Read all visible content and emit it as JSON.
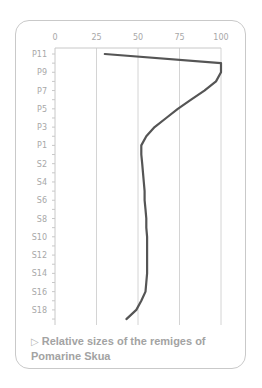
{
  "chart_data": {
    "type": "line",
    "orientation": "horizontal-values",
    "title": "Relative sizes of the remiges of Pomarine Skua",
    "xlabel": "",
    "ylabel": "",
    "xlim": [
      0,
      100
    ],
    "x_ticks": [
      "0",
      "25",
      "50",
      "75",
      "100"
    ],
    "grid": true,
    "legend": null,
    "categories": [
      "P11",
      "P10",
      "P9",
      "P8",
      "P7",
      "P6",
      "P5",
      "P4",
      "P3",
      "P2",
      "P1",
      "S1",
      "S2",
      "S3",
      "S4",
      "S5",
      "S6",
      "S7",
      "S8",
      "S9",
      "S10",
      "S11",
      "S12",
      "S13",
      "S14",
      "S15",
      "S16",
      "S17",
      "S18",
      "S19"
    ],
    "category_labels_shown": [
      "P11",
      "P9",
      "P7",
      "P5",
      "P3",
      "P1",
      "S2",
      "S4",
      "S6",
      "S8",
      "S10",
      "S12",
      "S14",
      "S16",
      "S18"
    ],
    "series": [
      {
        "name": "Relative size",
        "values": [
          30,
          100,
          100,
          97,
          90,
          82,
          74,
          67,
          60,
          55,
          52,
          52,
          52.5,
          53,
          53.5,
          54,
          54,
          54.5,
          55,
          55,
          55.5,
          55.5,
          55.5,
          55.5,
          55.5,
          55,
          54.5,
          52,
          49,
          43
        ]
      }
    ]
  },
  "caption": {
    "marker": "▷",
    "text": "Relative sizes of the remiges of Pomarine Skua"
  },
  "colors": {
    "line": "#555555",
    "grid": "#d4d4d4",
    "axis": "#c8c8c8",
    "label": "#a8a8a8",
    "caption": "#a3a3a3"
  }
}
